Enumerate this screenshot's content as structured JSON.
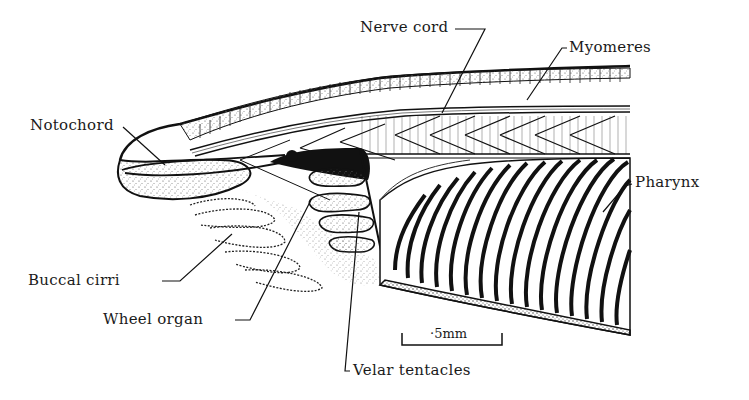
{
  "figure": {
    "labels": {
      "nerve_cord": "Nerve cord",
      "myomeres": "Myomeres",
      "notochord": "Notochord",
      "pharynx": "Pharynx",
      "buccal_cirri": "Buccal cirri",
      "wheel_organ": "Wheel organ",
      "velar_tentacles": "Velar tentacles"
    },
    "scale_bar": {
      "label": "·5mm"
    }
  }
}
